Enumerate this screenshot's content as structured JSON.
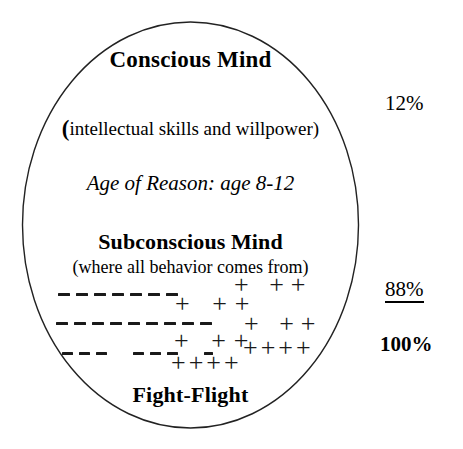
{
  "diagram": {
    "shape": "ellipse",
    "conscious": {
      "heading": "Conscious Mind",
      "open_paren": "(",
      "subtitle": "intellectual skills and willpower)",
      "age_note": "Age of Reason: age 8-12",
      "percent": "12%"
    },
    "subconscious": {
      "heading": "Subconscious Mind",
      "subtitle": "(where all behavior comes from)",
      "percent": "88%",
      "bottom_label": "Fight-Flight"
    },
    "total": {
      "percent": "100%"
    },
    "marks": {
      "dash_rows": [
        {
          "id": "dash-row-1",
          "pattern": [
            12,
            12,
            12,
            12,
            12,
            12,
            12
          ]
        },
        {
          "id": "dash-row-2",
          "pattern": [
            12,
            12,
            12,
            12,
            12,
            12,
            12,
            12,
            12
          ]
        },
        {
          "id": "dash-row-3",
          "pattern": [
            11,
            11,
            11,
            0,
            11,
            11,
            11,
            0,
            9
          ]
        }
      ],
      "plus_clusters": [
        {
          "id": "plus-cluster-a",
          "text": "+ ++"
        },
        {
          "id": "plus-cluster-b",
          "text": "+ ++"
        },
        {
          "id": "plus-cluster-c",
          "text": "+ ++"
        },
        {
          "id": "plus-cluster-d",
          "text": "+ ++"
        },
        {
          "id": "plus-cluster-e",
          "text": "++++"
        },
        {
          "id": "plus-cluster-f",
          "text": "++++"
        }
      ]
    },
    "colors": {
      "stroke": "#222222",
      "text": "#000000",
      "background": "#ffffff"
    }
  }
}
